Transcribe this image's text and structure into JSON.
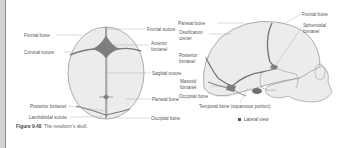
{
  "figure": {
    "number": "Figure 9.48",
    "caption": "The newborn's skull.",
    "panel_b_marker": "B",
    "panel_b_title": "Lateral view"
  },
  "superior_view": {
    "labels": {
      "frontal_bone": "Frontal bone",
      "coronal_suture": "Coronal suture",
      "posterior_fontanel": "Posterior fontanel",
      "lambdoidal_suture": "Lambdoidal suture",
      "frontal_suture": "Frontal suture",
      "anterior_fontanel_1": "Anterior",
      "anterior_fontanel_2": "fontanel",
      "sagittal_suture": "Sagittal suture",
      "parietal_bone": "Parietal bone",
      "occipital_bone": "Occipital bone"
    }
  },
  "lateral_view": {
    "labels": {
      "parietal_bone": "Parietal bone",
      "ossification_center_1": "Ossification",
      "ossification_center_2": "center",
      "posterior_fontanel_1": "Posterior",
      "posterior_fontanel_2": "fontanel",
      "mastoid_fontanel_1": "Mastoid",
      "mastoid_fontanel_2": "fontanel",
      "occipital_bone": "Occipital bone",
      "temporal_bone": "Temporal bone (squamous portion)",
      "frontal_bone": "Frontal bone",
      "sphenoidal_fontanel_1": "Sphenoidal",
      "sphenoidal_fontanel_2": "fontanel"
    }
  },
  "colors": {
    "bone_fill": "#ececec",
    "suture": "#7a7a7a",
    "outline": "#8c8c8c",
    "leader": "#9a9a9a"
  }
}
